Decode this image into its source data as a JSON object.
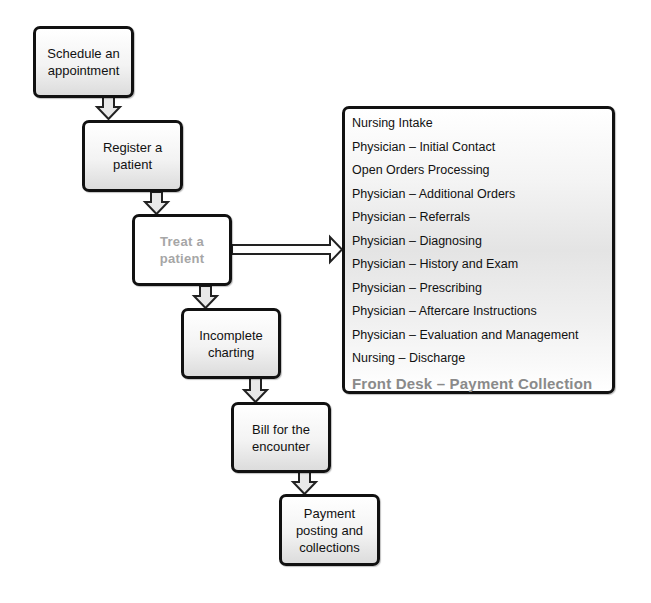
{
  "diagram": {
    "steps": [
      {
        "id": "schedule",
        "label": "Schedule an\nappointment",
        "style": "normal"
      },
      {
        "id": "register",
        "label": "Register a\npatient",
        "style": "normal"
      },
      {
        "id": "treat",
        "label": "Treat a\npatient",
        "style": "highlight"
      },
      {
        "id": "charting",
        "label": "Incomplete\ncharting",
        "style": "normal"
      },
      {
        "id": "bill",
        "label": "Bill for the\nencounter",
        "style": "normal"
      },
      {
        "id": "payment",
        "label": "Payment\nposting and\ncollections",
        "style": "normal"
      }
    ],
    "treat_detail": {
      "items": [
        "Nursing Intake",
        "Physician – Initial Contact",
        "Open Orders Processing",
        "Physician – Additional Orders",
        "Physician – Referrals",
        "Physician – Diagnosing",
        "Physician – History and Exam",
        "Physician – Prescribing",
        "Physician – Aftercare Instructions",
        "Physician – Evaluation and Management",
        "Nursing – Discharge"
      ],
      "highlighted_item": "Front Desk – Payment Collection"
    },
    "colors": {
      "border": "#111111",
      "highlight_text": "#a6a6a6",
      "arrow_fill": "#e8e8e8"
    }
  }
}
